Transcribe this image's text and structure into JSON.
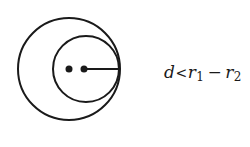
{
  "diagram": {
    "type": "two circles, internal tangency",
    "stroke_color": "#1a1a1a",
    "background": "#ffffff",
    "outer_circle": {
      "cx": 69,
      "cy": 69,
      "r": 51
    },
    "inner_circle": {
      "cx": 86,
      "cy": 69,
      "r": 33
    },
    "center_dots": [
      {
        "cx": 69,
        "cy": 69,
        "r": 3.5
      },
      {
        "cx": 84,
        "cy": 69,
        "r": 3.5
      }
    ],
    "radius_line": {
      "x1": 84,
      "y1": 69,
      "x2": 120,
      "y2": 69
    }
  },
  "label": {
    "d": "d",
    "relation": "<",
    "r1": "r",
    "r1_sub": "1",
    "minus": "−",
    "r2": "r",
    "r2_sub": "2",
    "full_text": "d<r1−r2"
  }
}
